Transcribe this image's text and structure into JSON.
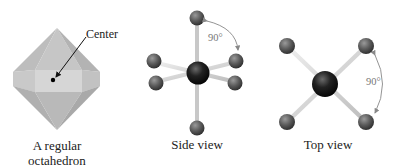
{
  "figure": {
    "panels": [
      {
        "id": "octahedron",
        "callout": "Center",
        "caption_line1": "A regular",
        "caption_line2": "octahedron"
      },
      {
        "id": "side-view",
        "angle_label": "90°",
        "caption": "Side view"
      },
      {
        "id": "top-view",
        "angle_label": "90°",
        "caption": "Top view"
      }
    ],
    "colors": {
      "octahedron_face": "#b9b9b9",
      "octahedron_band": "#d4d4d4",
      "ligand_atom": "#5a5a5a",
      "central_atom": "#1e1e1e",
      "bond": "#d8d8d8",
      "angle_arc": "#888888"
    }
  }
}
